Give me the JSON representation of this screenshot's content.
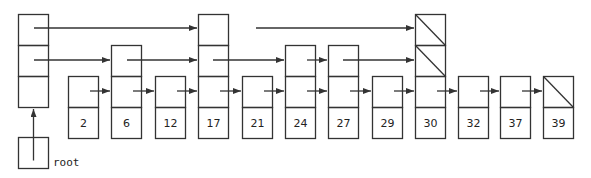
{
  "diagram": {
    "type": "skip-list",
    "stroke_color": "#333333",
    "cell_width": 30,
    "cell_height": 31,
    "base_top": 76,
    "root": {
      "label": "root",
      "x": 18,
      "y": 137
    },
    "header": {
      "x": 18,
      "levels": 3
    },
    "nodes": [
      {
        "key": "2",
        "x": 68,
        "levels": 1
      },
      {
        "key": "6",
        "x": 111,
        "levels": 2
      },
      {
        "key": "12",
        "x": 155,
        "levels": 1
      },
      {
        "key": "17",
        "x": 198,
        "levels": 3
      },
      {
        "key": "21",
        "x": 242,
        "levels": 1
      },
      {
        "key": "24",
        "x": 285,
        "levels": 2
      },
      {
        "key": "27",
        "x": 328,
        "levels": 2
      },
      {
        "key": "29",
        "x": 372,
        "levels": 1
      },
      {
        "key": "30",
        "x": 415,
        "levels": 3,
        "null_levels": [
          2,
          3
        ]
      },
      {
        "key": "32",
        "x": 458,
        "levels": 1
      },
      {
        "key": "37",
        "x": 500,
        "levels": 1
      },
      {
        "key": "39",
        "x": 543,
        "levels": 1,
        "null_levels": [
          1
        ]
      }
    ],
    "links": [
      {
        "level": 3,
        "from": "header",
        "to": "17",
        "x1": 34,
        "x2": 198
      },
      {
        "level": 3,
        "from": "17",
        "to": "30",
        "x1": 256,
        "x2": 415
      },
      {
        "level": 2,
        "from": "header",
        "to": "6",
        "x1": 34,
        "x2": 111
      },
      {
        "level": 2,
        "from": "6",
        "to": "17",
        "x1": 127,
        "x2": 198
      },
      {
        "level": 2,
        "from": "17",
        "to": "24",
        "x1": 213,
        "x2": 285
      },
      {
        "level": 2,
        "from": "24",
        "to": "27",
        "x1": 307,
        "x2": 328
      },
      {
        "level": 2,
        "from": "27",
        "to": "30",
        "x1": 343,
        "x2": 415
      },
      {
        "level": 1,
        "from": "2",
        "to": "6",
        "x1": 90,
        "x2": 111
      },
      {
        "level": 1,
        "from": "6",
        "to": "12",
        "x1": 133,
        "x2": 155
      },
      {
        "level": 1,
        "from": "12",
        "to": "17",
        "x1": 177,
        "x2": 198
      },
      {
        "level": 1,
        "from": "17",
        "to": "21",
        "x1": 220,
        "x2": 242
      },
      {
        "level": 1,
        "from": "21",
        "to": "24",
        "x1": 264,
        "x2": 285
      },
      {
        "level": 1,
        "from": "24",
        "to": "27",
        "x1": 307,
        "x2": 328
      },
      {
        "level": 1,
        "from": "27",
        "to": "29",
        "x1": 350,
        "x2": 372
      },
      {
        "level": 1,
        "from": "29",
        "to": "30",
        "x1": 394,
        "x2": 415
      },
      {
        "level": 1,
        "from": "30",
        "to": "32",
        "x1": 437,
        "x2": 458
      },
      {
        "level": 1,
        "from": "32",
        "to": "37",
        "x1": 480,
        "x2": 500
      },
      {
        "level": 1,
        "from": "37",
        "to": "39",
        "x1": 522,
        "x2": 543
      }
    ]
  }
}
